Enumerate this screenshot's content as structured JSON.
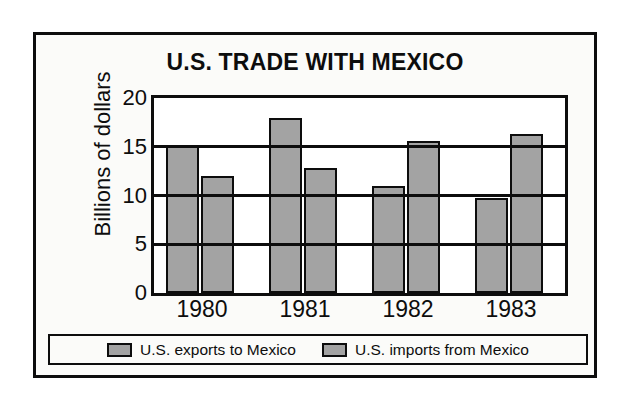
{
  "chart_data": {
    "type": "bar",
    "title": "U.S. TRADE WITH MEXICO",
    "xlabel": "",
    "ylabel": "Billions of dollars",
    "categories": [
      "1980",
      "1981",
      "1982",
      "1983"
    ],
    "series": [
      {
        "name": "U.S. exports to Mexico",
        "values": [
          15.2,
          18.0,
          11.0,
          9.7
        ],
        "color": "#a3a3a3"
      },
      {
        "name": "U.S. imports from Mexico",
        "values": [
          12.0,
          12.8,
          15.6,
          16.3
        ],
        "color": "#a3a3a3"
      }
    ],
    "ylim": [
      0,
      20
    ],
    "yticks": [
      0,
      5,
      10,
      15,
      20
    ],
    "ytick_labels": [
      "0",
      "5",
      "10",
      "15",
      "20"
    ],
    "grid": true,
    "grid_axis": "y",
    "legend_position": "bottom"
  },
  "legend": {
    "items": [
      {
        "label": "U.S. exports to Mexico"
      },
      {
        "label": "U.S. imports from Mexico"
      }
    ]
  },
  "colors": {
    "bar_fill": "#a3a3a3",
    "ink": "#0d0d0d",
    "plot_background": "#ffffff",
    "figure_background": "#fbfbf9"
  }
}
